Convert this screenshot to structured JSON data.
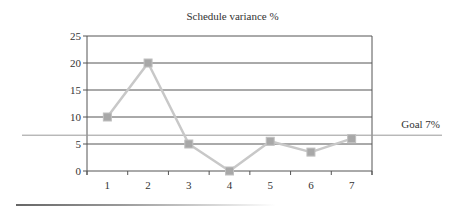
{
  "chart_data": {
    "type": "line",
    "title": "Schedule variance %",
    "xlabel": "",
    "ylabel": "",
    "categories": [
      "1",
      "2",
      "3",
      "4",
      "5",
      "6",
      "7"
    ],
    "series": [
      {
        "name": "Schedule variance %",
        "values": [
          10,
          20,
          5,
          0,
          5.5,
          3.5,
          6
        ],
        "color": "#c8c8c8",
        "marker": "square",
        "marker_color": "#a8a8a8"
      }
    ],
    "ylim": [
      0,
      25
    ],
    "yticks": [
      0,
      5,
      10,
      15,
      20,
      25
    ],
    "grid": true,
    "legend": "none",
    "annotations": [
      {
        "type": "hline",
        "y": 7,
        "label": "Goal 7%",
        "color": "#999999"
      }
    ]
  },
  "title": "Schedule variance %",
  "goal_label": "Goal 7%",
  "y_tick_labels": [
    "0",
    "5",
    "10",
    "15",
    "20",
    "25"
  ],
  "x_tick_labels": [
    "1",
    "2",
    "3",
    "4",
    "5",
    "6",
    "7"
  ]
}
